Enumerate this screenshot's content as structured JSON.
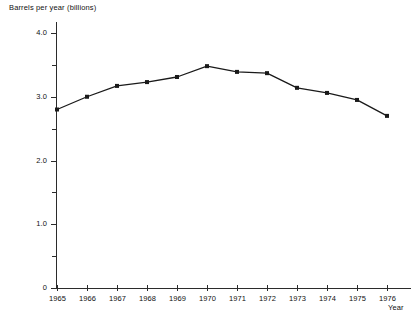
{
  "chart_data": {
    "type": "line",
    "title": "",
    "xlabel": "Year",
    "ylabel": "Barrels per year (billions)",
    "categories": [
      "1965",
      "1966",
      "1967",
      "1968",
      "1969",
      "1970",
      "1971",
      "1972",
      "1973",
      "1974",
      "1975",
      "1976"
    ],
    "x": [
      1965,
      1966,
      1967,
      1968,
      1969,
      1970,
      1971,
      1972,
      1973,
      1974,
      1975,
      1976
    ],
    "values": [
      2.8,
      3.0,
      3.17,
      3.23,
      3.31,
      3.48,
      3.39,
      3.37,
      3.14,
      3.06,
      2.95,
      2.7
    ],
    "ylim": [
      0,
      4.2
    ],
    "xlim": [
      1964.5,
      1976.5
    ],
    "ytick_labels": [
      "0",
      "1.0",
      "2.0",
      "3.0",
      "4.0"
    ],
    "ytick_values": [
      0,
      1.0,
      2.0,
      3.0,
      4.0
    ],
    "yminor_values": [
      0.5,
      1.5,
      2.5,
      3.5
    ],
    "grid": false,
    "legend": "none",
    "marker": "filled-square",
    "line_color": "#1a1a1a",
    "background_color": "#ffffff"
  }
}
